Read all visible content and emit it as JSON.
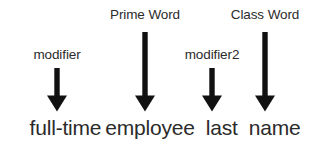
{
  "diagram": {
    "type": "annotation-arrows",
    "background_color": "#ffffff",
    "text_color": "#2b2b2b",
    "arrow_color": "#111111",
    "annotations": [
      {
        "label": "modifier",
        "target_word": "full-time",
        "label_x": 57,
        "label_baseline_y": 62,
        "arrow_x": 57,
        "arrow_top_y": 68,
        "arrow_bottom_y": 111,
        "length": "short"
      },
      {
        "label": "Prime Word",
        "target_word": "employee",
        "label_x": 145,
        "label_baseline_y": 22,
        "arrow_x": 145,
        "arrow_top_y": 32,
        "arrow_bottom_y": 111,
        "length": "long"
      },
      {
        "label": "modifier2",
        "target_word": "last",
        "label_x": 212,
        "label_baseline_y": 62,
        "arrow_x": 212,
        "arrow_top_y": 68,
        "arrow_bottom_y": 111,
        "length": "short"
      },
      {
        "label": "Class Word",
        "target_word": "name",
        "label_x": 265,
        "label_baseline_y": 22,
        "arrow_x": 265,
        "arrow_top_y": 32,
        "arrow_bottom_y": 111,
        "length": "long"
      }
    ],
    "phrase": {
      "full_text": "full-time employee last name",
      "words": [
        "full-time",
        "employee",
        "last",
        "name"
      ]
    }
  }
}
